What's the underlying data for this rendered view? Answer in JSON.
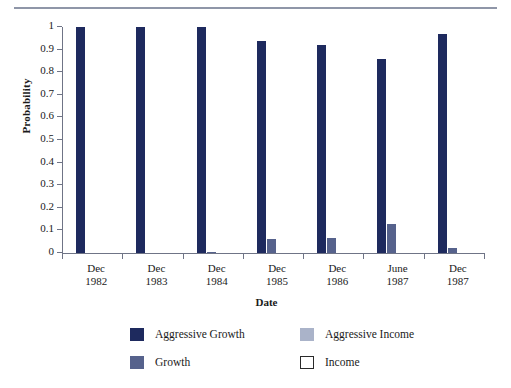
{
  "chart_data": {
    "type": "bar",
    "title": "",
    "xlabel": "Date",
    "ylabel": "Probability",
    "categories": [
      "Dec 1982",
      "Dec 1983",
      "Dec 1984",
      "Dec 1985",
      "Dec 1986",
      "June 1987",
      "Dec 1987"
    ],
    "category_lines": [
      [
        "Dec",
        "1982"
      ],
      [
        "Dec",
        "1983"
      ],
      [
        "Dec",
        "1984"
      ],
      [
        "Dec",
        "1985"
      ],
      [
        "Dec",
        "1986"
      ],
      [
        "June",
        "1987"
      ],
      [
        "Dec",
        "1987"
      ]
    ],
    "ylim": [
      0,
      1
    ],
    "ytick_labels": [
      "1",
      "0.9",
      "0.8",
      "0.7",
      "0.6",
      "0.5",
      "0.4",
      "0.3",
      "0.2",
      "0.1",
      "0"
    ],
    "ytick_values": [
      1,
      0.9,
      0.8,
      0.7,
      0.6,
      0.5,
      0.4,
      0.3,
      0.2,
      0.1,
      0
    ],
    "grid": false,
    "legend_position": "below",
    "series": [
      {
        "name": "Aggressive Growth",
        "color": "#1e2a5e",
        "values": [
          1.0,
          1.0,
          1.0,
          0.94,
          0.92,
          0.86,
          0.97
        ]
      },
      {
        "name": "Growth",
        "color": "#56628c",
        "values": [
          0.0,
          0.0,
          0.005,
          0.06,
          0.065,
          0.13,
          0.02
        ]
      },
      {
        "name": "Aggressive Income",
        "color": "#aab3c9",
        "values": [
          0.0,
          0.0,
          0.0,
          0.0,
          0.0,
          0.0,
          0.0
        ]
      },
      {
        "name": "Income",
        "color": "#ffffff",
        "values": [
          0.0,
          0.0,
          0.0,
          0.0,
          0.0,
          0.0,
          0.0
        ]
      }
    ]
  },
  "legend": {
    "entries": [
      {
        "label": "Aggressive Growth",
        "color": "#1e2a5e",
        "border": "none"
      },
      {
        "label": "Aggressive Income",
        "color": "#aab3c9",
        "border": "none"
      },
      {
        "label": "Growth",
        "color": "#56628c",
        "border": "none"
      },
      {
        "label": "Income",
        "color": "#ffffff",
        "border": "#2a2a2a"
      }
    ]
  }
}
